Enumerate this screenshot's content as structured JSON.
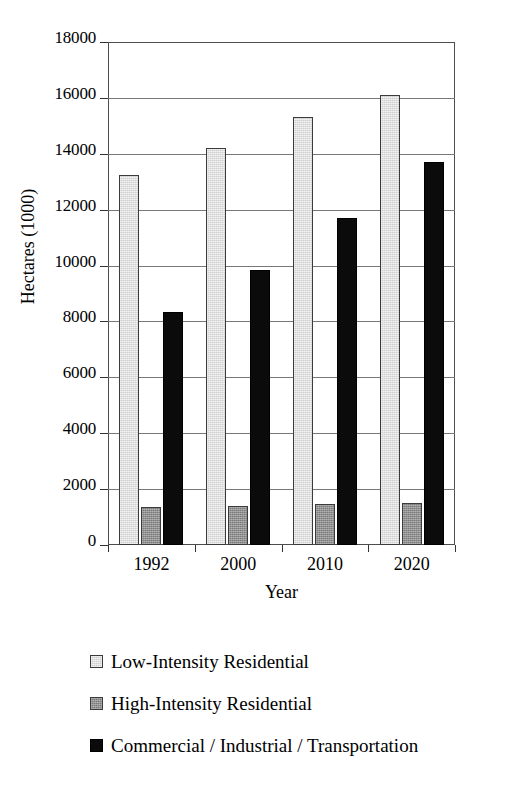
{
  "chart_data": {
    "type": "bar",
    "title": "",
    "subtitle": "",
    "xlabel": "Year",
    "ylabel": "Hectares (1000)",
    "categories": [
      "1992",
      "2000",
      "2010",
      "2020"
    ],
    "series": [
      {
        "name": "Low-Intensity Residential",
        "color": "#cfcfcf",
        "values": [
          13250,
          14200,
          15300,
          16100
        ]
      },
      {
        "name": "High-Intensity Residential",
        "color": "#7a7a7a",
        "values": [
          1350,
          1400,
          1450,
          1500
        ]
      },
      {
        "name": "Commercial / Industrial / Transportation",
        "color": "#0b0b0b",
        "values": [
          8350,
          9850,
          11700,
          13700
        ]
      }
    ],
    "ylim": [
      0,
      18000
    ],
    "yticks": [
      0,
      2000,
      4000,
      6000,
      8000,
      10000,
      12000,
      14000,
      16000,
      18000
    ],
    "ytick_labels": [
      "0",
      "2000",
      "4000",
      "6000",
      "8000",
      "10000",
      "12000",
      "14000",
      "16000",
      "18000"
    ],
    "grid": "horizontal",
    "legend_position": "below",
    "legend": [
      "Low-Intensity Residential",
      "High-Intensity Residential",
      "Commercial / Industrial / Transportation"
    ]
  }
}
